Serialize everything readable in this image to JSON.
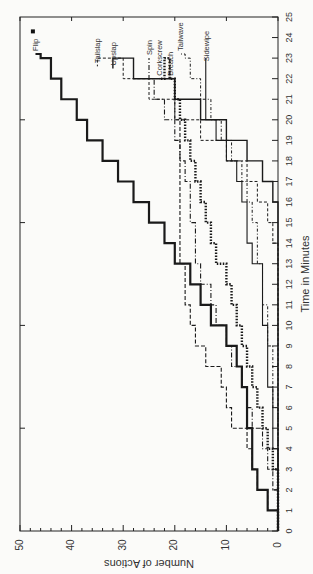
{
  "chart_data": {
    "type": "line",
    "step": true,
    "rotated": "90deg-clockwise",
    "title": "",
    "xlabel": "Time in Minutes",
    "ylabel": "Number of Actions",
    "xlim": [
      0,
      25
    ],
    "ylim": [
      0,
      50
    ],
    "x_ticks": [
      0,
      1,
      2,
      3,
      4,
      5,
      6,
      7,
      8,
      9,
      10,
      11,
      12,
      13,
      14,
      15,
      16,
      17,
      18,
      19,
      20,
      21,
      22,
      23,
      24,
      25
    ],
    "y_ticks": [
      0,
      10,
      20,
      30,
      40,
      50
    ],
    "grid": false,
    "legend": "inline labels",
    "x": [
      0,
      1,
      2,
      3,
      4,
      5,
      6,
      7,
      8,
      9,
      10,
      11,
      12,
      13,
      14,
      15,
      16,
      17,
      18,
      19,
      20,
      21,
      22,
      23
    ],
    "series": [
      {
        "name": "Flip",
        "style": "solid-thick",
        "values": [
          0,
          2,
          4,
          5,
          5,
          6,
          6,
          7,
          8,
          10,
          13,
          15,
          17,
          20,
          22,
          25,
          28,
          31,
          34,
          37,
          39,
          42,
          44,
          46
        ],
        "end": [
          23.2,
          47
        ]
      },
      {
        "name": "Breach",
        "style": "dashed",
        "values": [
          0,
          2,
          4,
          5,
          6,
          9,
          10,
          11,
          14,
          16,
          17,
          18,
          18,
          19,
          19,
          19,
          19,
          19,
          19,
          19,
          20,
          20,
          21,
          21
        ],
        "end": [
          22.0,
          21
        ]
      },
      {
        "name": "Spin",
        "style": "dash-dot",
        "values": [
          0,
          0,
          1,
          2,
          3,
          5,
          6,
          7,
          9,
          10,
          12,
          13,
          15,
          16,
          16,
          17,
          17,
          18,
          19,
          20,
          22,
          24,
          25,
          25
        ],
        "end": [
          23.0,
          25
        ]
      },
      {
        "name": "Corkscrew",
        "style": "dotted-heavy",
        "values": [
          0,
          0,
          0,
          1,
          2,
          3,
          4,
          5,
          6,
          7,
          8,
          9,
          10,
          12,
          13,
          14,
          15,
          16,
          17,
          18,
          19,
          20,
          21,
          22
        ],
        "end": [
          22.0,
          23
        ]
      },
      {
        "name": "Tailwave",
        "style": "dash-dot-fine",
        "values": [
          0,
          0,
          0,
          0,
          0,
          0,
          1,
          1,
          1,
          2,
          2,
          3,
          3,
          4,
          4,
          5,
          6,
          7,
          9,
          11,
          13,
          15,
          17,
          18
        ],
        "end": [
          23.2,
          19
        ]
      },
      {
        "name": "Sidewipe",
        "style": "solid-thin",
        "values": [
          0,
          0,
          0,
          0,
          1,
          1,
          1,
          2,
          2,
          2,
          3,
          3,
          3,
          5,
          6,
          6,
          7,
          8,
          10,
          12,
          14,
          14,
          14,
          14
        ],
        "end": [
          22.7,
          14
        ]
      },
      {
        "name": "Upslap",
        "style": "solid",
        "values": [
          0,
          0,
          0,
          0,
          0,
          0,
          0,
          0,
          0,
          0,
          0,
          0,
          0,
          0,
          0,
          0,
          1,
          3,
          6,
          10,
          15,
          20,
          28,
          32
        ],
        "end": [
          22.5,
          32
        ]
      },
      {
        "name": "Tailslap",
        "style": "dashed-fine",
        "values": [
          0,
          0,
          0,
          0,
          0,
          0,
          0,
          0,
          0,
          0,
          0,
          0,
          0,
          0,
          1,
          2,
          4,
          6,
          10,
          15,
          20,
          25,
          30,
          35
        ],
        "end": [
          22.6,
          35
        ]
      }
    ],
    "annotations": [
      "Flip",
      "Breach",
      "Spin",
      "Corkscrew",
      "Tailwave",
      "Sidewipe",
      "Upslap",
      "Tailslap"
    ]
  }
}
